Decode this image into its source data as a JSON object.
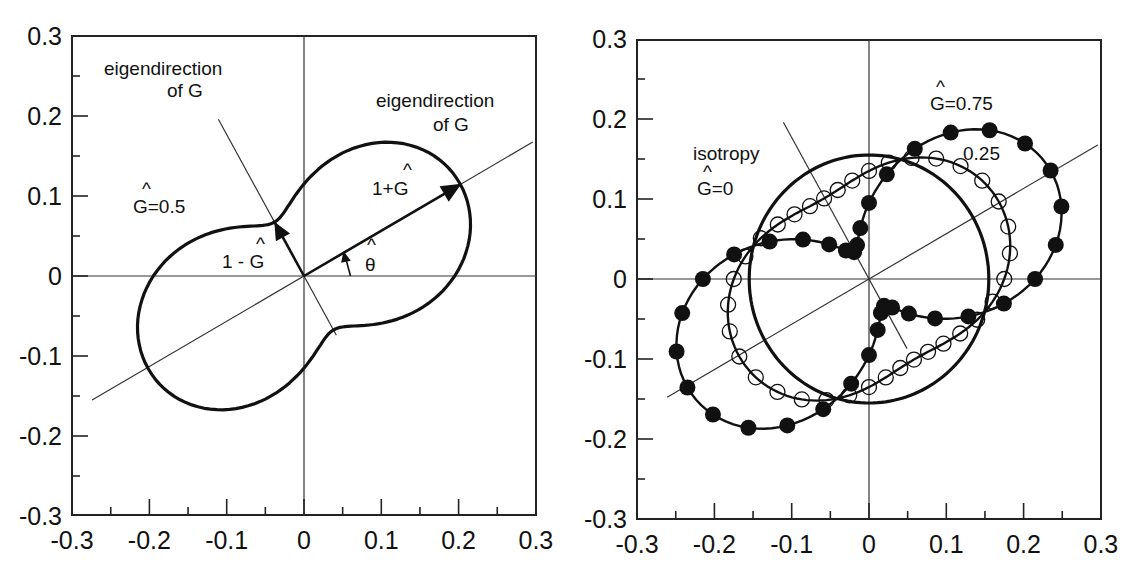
{
  "chart_data": [
    {
      "type": "line",
      "subtype": "polar-curve",
      "panel": "left",
      "title": "",
      "xlabel": "",
      "ylabel": "",
      "xlim": [
        -0.3,
        0.3
      ],
      "ylim": [
        -0.3,
        0.3
      ],
      "xticks": [
        "-0.3",
        "-0.2",
        "-0.1",
        "0",
        "0.1",
        "0.2",
        "0.3"
      ],
      "yticks": [
        "0.3",
        "0.2",
        "0.1",
        "0",
        "-0.1",
        "-0.2",
        "-0.3"
      ],
      "grid": false,
      "eigen_angle_deg": 29.5,
      "base_radius": 0.155,
      "series": [
        {
          "name": "G=0.5",
          "G": 0.5,
          "markers": "none"
        }
      ],
      "annotations": [
        {
          "text": "eigendirection",
          "line2": "of G",
          "x": -0.17,
          "y": 0.235
        },
        {
          "text": "eigendirection",
          "line2": "of G",
          "x": 0.16,
          "y": 0.2
        },
        {
          "text": "Ĝ=0.5",
          "x": -0.2,
          "y": 0.085
        },
        {
          "text": "1+Ĝ",
          "x": 0.115,
          "y": 0.115
        },
        {
          "text": "1 - Ĝ",
          "x": -0.1,
          "y": 0.015
        },
        {
          "text": "θ̂",
          "x": 0.08,
          "y": 0.028
        }
      ],
      "arrows": [
        {
          "label": "1+G",
          "r": 0.234
        },
        {
          "label": "1-G",
          "r": 0.078
        }
      ]
    },
    {
      "type": "line",
      "subtype": "polar-curve",
      "panel": "right",
      "title": "",
      "xlabel": "",
      "ylabel": "",
      "xlim": [
        -0.3,
        0.3
      ],
      "ylim": [
        -0.3,
        0.3
      ],
      "xticks": [
        "-0.3",
        "-0.2",
        "-0.1",
        "0",
        "0.1",
        "0.2",
        "0.3"
      ],
      "yticks": [
        "0.3",
        "0.2",
        "0.1",
        "0",
        "-0.1",
        "-0.2",
        "-0.3"
      ],
      "grid": false,
      "eigen_angle_deg": 29.5,
      "base_radius": 0.155,
      "series": [
        {
          "name": "isotropy G=0",
          "G": 0,
          "markers": "none"
        },
        {
          "name": "G=0.25",
          "G": 0.25,
          "markers": "open-circle",
          "marker_step_deg": 10
        },
        {
          "name": "G=0.75",
          "G": 0.75,
          "markers": "filled-circle",
          "marker_step_deg": 10
        }
      ],
      "annotations": [
        {
          "text": "isotropy",
          "x": -0.22,
          "y": 0.15
        },
        {
          "text": "Ĝ=0",
          "x": -0.2,
          "y": 0.1
        },
        {
          "text": "Ĝ=0.75",
          "x": 0.06,
          "y": 0.21
        },
        {
          "text": "0.25",
          "x": 0.115,
          "y": 0.155
        }
      ]
    }
  ],
  "left": {
    "annot_eig1_l1": "eigendirection",
    "annot_eig1_l2": "of G",
    "annot_eig2_l1": "eigendirection",
    "annot_eig2_l2": "of G",
    "annot_g": "G=0.5",
    "annot_1pg": "1+G",
    "annot_1mg": "1 - G",
    "annot_theta": "θ"
  },
  "right": {
    "annot_iso": "isotropy",
    "annot_g0": "G=0",
    "annot_g075": "G=0.75",
    "annot_g025": "0.25"
  },
  "ticks": {
    "x": [
      "-0.3",
      "-0.2",
      "-0.1",
      "0",
      "0.1",
      "0.2",
      "0.3"
    ],
    "y": [
      "0.3",
      "0.2",
      "0.1",
      "0",
      "-0.1",
      "-0.2",
      "-0.3"
    ]
  }
}
